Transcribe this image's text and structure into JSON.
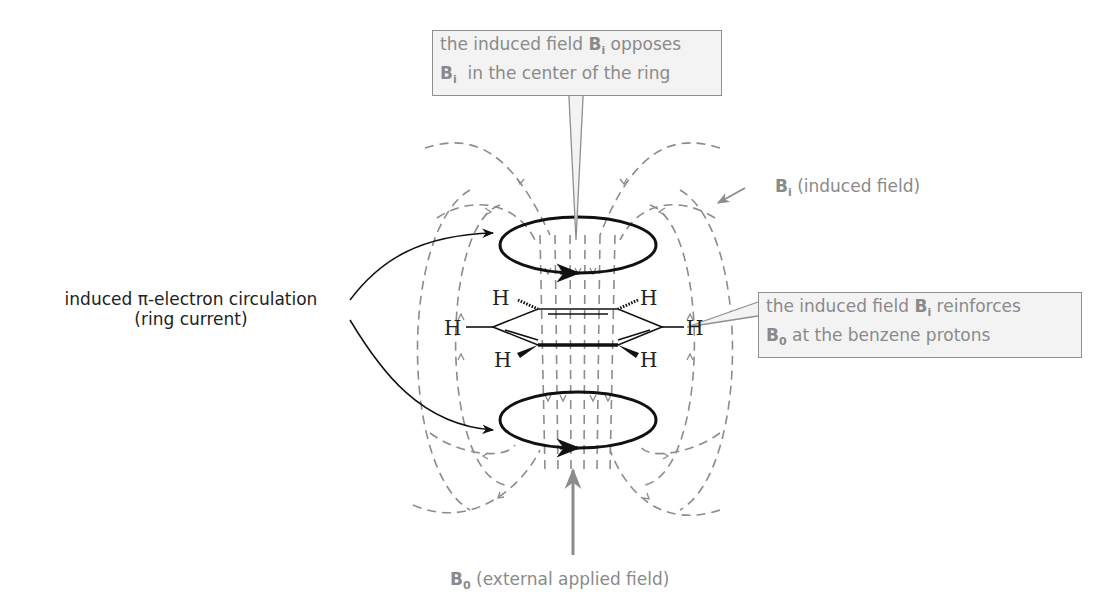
{
  "callouts": {
    "top": {
      "line1_prefix": "the induced field ",
      "line1_symbol": "B",
      "line1_sub": "i",
      "line1_suffix": " opposes",
      "line2_symbol": "B",
      "line2_sub": "i",
      "line2_suffix": "  in the center of the ring"
    },
    "right": {
      "line1_prefix": "the induced field ",
      "line1_symbol": "B",
      "line1_sub": "i",
      "line1_suffix": " reinforces",
      "line2_symbol": "B",
      "line2_sub": "0",
      "line2_suffix": " at the benzene protons"
    }
  },
  "labels": {
    "induced_field": {
      "symbol": "B",
      "sub": "i",
      "text": " (induced field)"
    },
    "external_field": {
      "symbol": "B",
      "sub": "0",
      "text": " (external applied field)"
    },
    "ring_current": {
      "line1": "induced π-electron circulation",
      "line2": "(ring current)"
    }
  },
  "molecule": {
    "name": "benzene",
    "hydrogens": [
      "H",
      "H",
      "H",
      "H",
      "H",
      "H"
    ]
  },
  "colors": {
    "field_lines": "#8c8c8c",
    "ring_current": "#111111",
    "callout_bg": "#f3f3f3",
    "callout_border": "#8f8f8f",
    "label_text": "#8a8a8a"
  }
}
